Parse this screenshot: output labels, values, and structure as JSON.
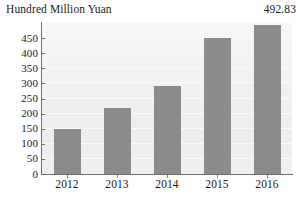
{
  "axis_title": "Hundred Million Yuan",
  "peak_annotation": "492.83",
  "chart_data": {
    "type": "bar",
    "title": "",
    "subtitle": "",
    "xlabel": "",
    "ylabel": "Hundred Million Yuan",
    "categories": [
      "2012",
      "2013",
      "2014",
      "2015",
      "2016"
    ],
    "values": [
      148,
      218,
      290,
      450,
      492.83
    ],
    "ylim": [
      0,
      500
    ],
    "yticks": [
      0,
      50,
      100,
      150,
      200,
      250,
      300,
      350,
      400,
      450
    ],
    "ytick_labels": [
      "0",
      "50",
      "100",
      "150",
      "200",
      "250",
      "300",
      "350",
      "400",
      "450"
    ],
    "grid": true,
    "legend": false,
    "legend_position": "none",
    "annotations": [
      {
        "text": "492.83",
        "target_category": "2016",
        "position": "above-bar"
      }
    ],
    "bar_color": "#8c8c8c",
    "plot_background": "#f1f1f1",
    "axis_color": "#6e6e6e",
    "text_color": "#1a1a1a"
  }
}
